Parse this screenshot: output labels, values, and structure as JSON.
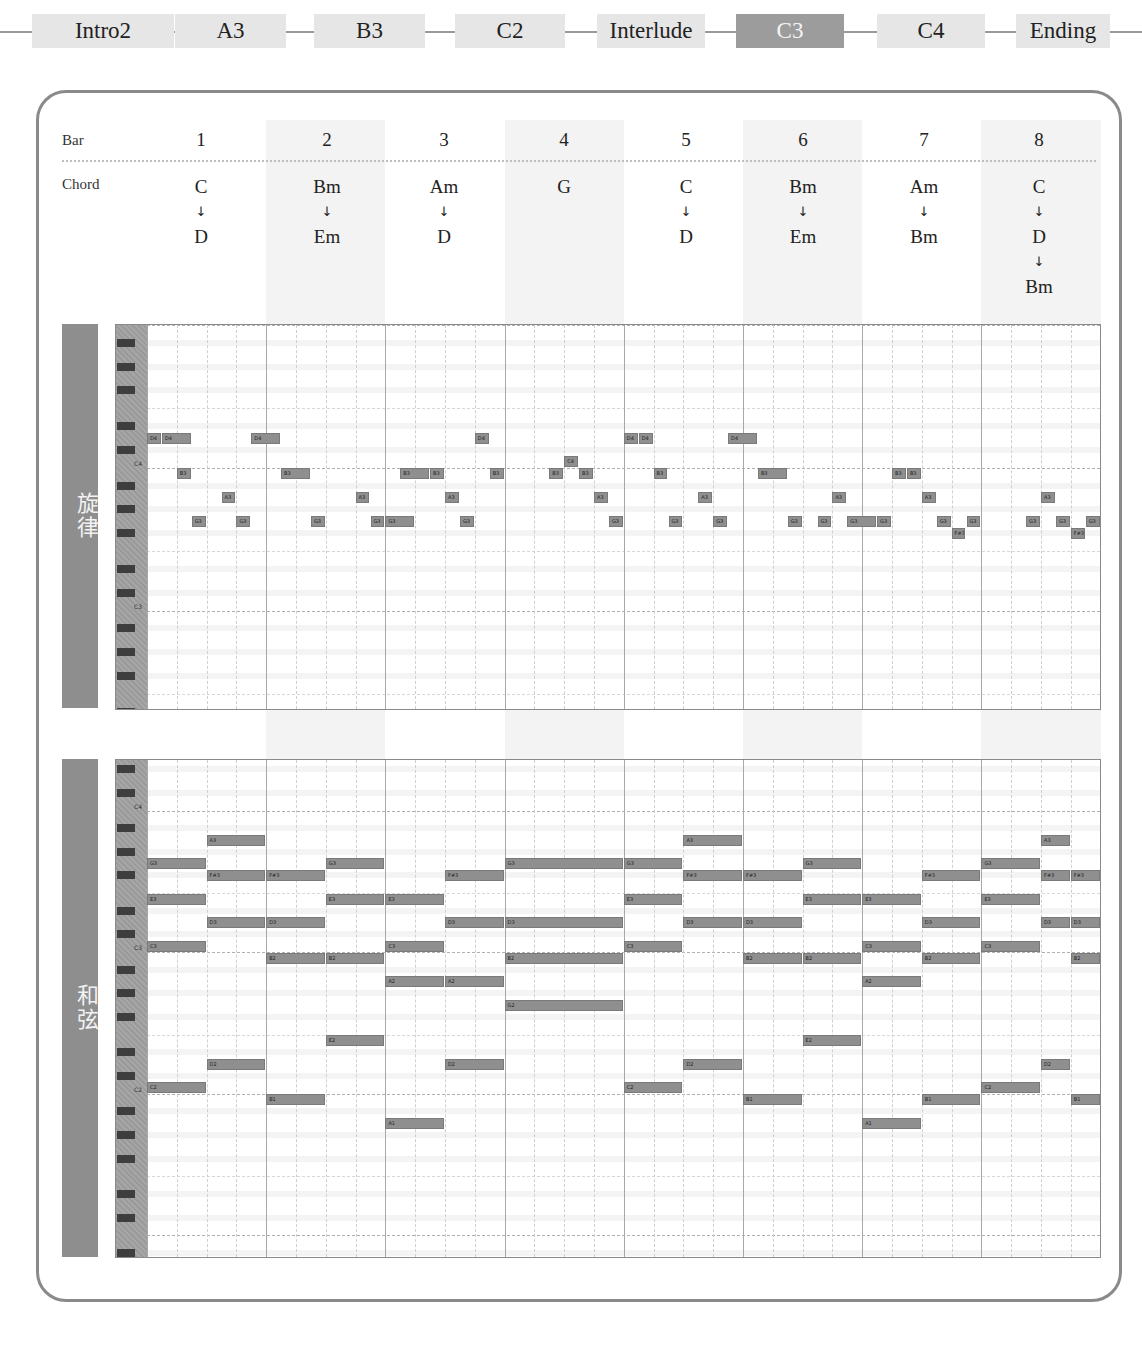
{
  "sections": {
    "items": [
      {
        "label": "Intro2",
        "active": false
      },
      {
        "label": "A3",
        "active": false
      },
      {
        "label": "B3",
        "active": false
      },
      {
        "label": "C2",
        "active": false
      },
      {
        "label": "Interlude",
        "active": false
      },
      {
        "label": "C3",
        "active": true
      },
      {
        "label": "C4",
        "active": false
      },
      {
        "label": "Ending",
        "active": false
      }
    ]
  },
  "header": {
    "bar_label": "Bar",
    "chord_label": "Chord",
    "bars": [
      "1",
      "2",
      "3",
      "4",
      "5",
      "6",
      "7",
      "8"
    ],
    "chords": [
      [
        "C",
        "D"
      ],
      [
        "Bm",
        "Em"
      ],
      [
        "Am",
        "D"
      ],
      [
        "G"
      ],
      [
        "C",
        "D"
      ],
      [
        "Bm",
        "Em"
      ],
      [
        "Am",
        "Bm"
      ],
      [
        "C",
        "D",
        "Bm"
      ]
    ],
    "arrow_glyph": "↓"
  },
  "melody": {
    "label": "旋律",
    "octave_labels": [
      "C4",
      "C3"
    ],
    "notes": [
      {
        "n": "D4",
        "s": 0,
        "d": 0.5
      },
      {
        "n": "D4",
        "s": 0.5,
        "d": 1
      },
      {
        "n": "B3",
        "s": 1,
        "d": 0.5
      },
      {
        "n": "G3",
        "s": 1.5,
        "d": 0.5
      },
      {
        "n": "A3",
        "s": 2.5,
        "d": 0.5
      },
      {
        "n": "G3",
        "s": 3,
        "d": 0.5
      },
      {
        "n": "D4",
        "s": 3.5,
        "d": 1
      },
      {
        "n": "B3",
        "s": 4.5,
        "d": 1
      },
      {
        "n": "G3",
        "s": 5.5,
        "d": 0.5
      },
      {
        "n": "A3",
        "s": 7,
        "d": 0.5
      },
      {
        "n": "G3",
        "s": 7.5,
        "d": 0.5
      },
      {
        "n": "G3",
        "s": 8,
        "d": 1
      },
      {
        "n": "B3",
        "s": 8.5,
        "d": 1
      },
      {
        "n": "B3",
        "s": 9.5,
        "d": 0.5
      },
      {
        "n": "A3",
        "s": 10,
        "d": 0.5
      },
      {
        "n": "G3",
        "s": 10.5,
        "d": 0.5
      },
      {
        "n": "D4",
        "s": 11,
        "d": 0.5
      },
      {
        "n": "B3",
        "s": 11.5,
        "d": 0.5
      },
      {
        "n": "B3",
        "s": 13.5,
        "d": 0.5
      },
      {
        "n": "C4",
        "s": 14,
        "d": 0.5
      },
      {
        "n": "B3",
        "s": 14.5,
        "d": 0.5
      },
      {
        "n": "A3",
        "s": 15,
        "d": 0.5
      },
      {
        "n": "G3",
        "s": 15.5,
        "d": 0.5
      },
      {
        "n": "D4",
        "s": 16,
        "d": 0.5
      },
      {
        "n": "D4",
        "s": 16.5,
        "d": 0.5
      },
      {
        "n": "B3",
        "s": 17,
        "d": 0.5
      },
      {
        "n": "G3",
        "s": 17.5,
        "d": 0.5
      },
      {
        "n": "A3",
        "s": 18.5,
        "d": 0.5
      },
      {
        "n": "G3",
        "s": 19,
        "d": 0.5
      },
      {
        "n": "D4",
        "s": 19.5,
        "d": 1
      },
      {
        "n": "B3",
        "s": 20.5,
        "d": 1
      },
      {
        "n": "G3",
        "s": 21.5,
        "d": 0.5
      },
      {
        "n": "G3",
        "s": 22.5,
        "d": 0.5
      },
      {
        "n": "A3",
        "s": 23,
        "d": 0.5
      },
      {
        "n": "G3",
        "s": 23.5,
        "d": 1
      },
      {
        "n": "G3",
        "s": 24.5,
        "d": 0.5
      },
      {
        "n": "B3",
        "s": 25,
        "d": 0.5
      },
      {
        "n": "B3",
        "s": 25.5,
        "d": 0.5
      },
      {
        "n": "A3",
        "s": 26,
        "d": 0.5
      },
      {
        "n": "G3",
        "s": 26.5,
        "d": 0.5
      },
      {
        "n": "F#3",
        "s": 27,
        "d": 0.5
      },
      {
        "n": "G3",
        "s": 27.5,
        "d": 0.5
      },
      {
        "n": "G3",
        "s": 29.5,
        "d": 0.5
      },
      {
        "n": "A3",
        "s": 30,
        "d": 0.5
      },
      {
        "n": "G3",
        "s": 30.5,
        "d": 0.5
      },
      {
        "n": "F#3",
        "s": 31,
        "d": 0.5
      },
      {
        "n": "G3",
        "s": 31.5,
        "d": 0.5
      }
    ]
  },
  "harmony": {
    "label": "和弦",
    "octave_labels": [
      "C4",
      "C3",
      "C2"
    ],
    "notes": [
      {
        "n": "G3",
        "s": 0,
        "d": 2
      },
      {
        "n": "E3",
        "s": 0,
        "d": 2
      },
      {
        "n": "C3",
        "s": 0,
        "d": 2
      },
      {
        "n": "C2",
        "s": 0,
        "d": 2
      },
      {
        "n": "A3",
        "s": 2,
        "d": 2
      },
      {
        "n": "F#3",
        "s": 2,
        "d": 2
      },
      {
        "n": "D3",
        "s": 2,
        "d": 2
      },
      {
        "n": "D2",
        "s": 2,
        "d": 2
      },
      {
        "n": "F#3",
        "s": 4,
        "d": 2
      },
      {
        "n": "D3",
        "s": 4,
        "d": 2
      },
      {
        "n": "B2",
        "s": 4,
        "d": 2
      },
      {
        "n": "B1",
        "s": 4,
        "d": 2
      },
      {
        "n": "G3",
        "s": 6,
        "d": 2
      },
      {
        "n": "E3",
        "s": 6,
        "d": 2
      },
      {
        "n": "B2",
        "s": 6,
        "d": 2
      },
      {
        "n": "E2",
        "s": 6,
        "d": 2
      },
      {
        "n": "E3",
        "s": 8,
        "d": 2
      },
      {
        "n": "C3",
        "s": 8,
        "d": 2
      },
      {
        "n": "A2",
        "s": 8,
        "d": 2
      },
      {
        "n": "A1",
        "s": 8,
        "d": 2
      },
      {
        "n": "F#3",
        "s": 10,
        "d": 2
      },
      {
        "n": "D3",
        "s": 10,
        "d": 2
      },
      {
        "n": "A2",
        "s": 10,
        "d": 2
      },
      {
        "n": "D2",
        "s": 10,
        "d": 2
      },
      {
        "n": "G3",
        "s": 12,
        "d": 4
      },
      {
        "n": "D3",
        "s": 12,
        "d": 4
      },
      {
        "n": "B2",
        "s": 12,
        "d": 4
      },
      {
        "n": "G2",
        "s": 12,
        "d": 4
      },
      {
        "n": "G3",
        "s": 16,
        "d": 2
      },
      {
        "n": "E3",
        "s": 16,
        "d": 2
      },
      {
        "n": "C3",
        "s": 16,
        "d": 2
      },
      {
        "n": "C2",
        "s": 16,
        "d": 2
      },
      {
        "n": "A3",
        "s": 18,
        "d": 2
      },
      {
        "n": "F#3",
        "s": 18,
        "d": 2
      },
      {
        "n": "D3",
        "s": 18,
        "d": 2
      },
      {
        "n": "D2",
        "s": 18,
        "d": 2
      },
      {
        "n": "F#3",
        "s": 20,
        "d": 2
      },
      {
        "n": "D3",
        "s": 20,
        "d": 2
      },
      {
        "n": "B2",
        "s": 20,
        "d": 2
      },
      {
        "n": "B1",
        "s": 20,
        "d": 2
      },
      {
        "n": "G3",
        "s": 22,
        "d": 2
      },
      {
        "n": "E3",
        "s": 22,
        "d": 2
      },
      {
        "n": "B2",
        "s": 22,
        "d": 2
      },
      {
        "n": "E2",
        "s": 22,
        "d": 2
      },
      {
        "n": "E3",
        "s": 24,
        "d": 2
      },
      {
        "n": "C3",
        "s": 24,
        "d": 2
      },
      {
        "n": "A2",
        "s": 24,
        "d": 2
      },
      {
        "n": "A1",
        "s": 24,
        "d": 2
      },
      {
        "n": "F#3",
        "s": 26,
        "d": 2
      },
      {
        "n": "D3",
        "s": 26,
        "d": 2
      },
      {
        "n": "B2",
        "s": 26,
        "d": 2
      },
      {
        "n": "B1",
        "s": 26,
        "d": 2
      },
      {
        "n": "G3",
        "s": 28,
        "d": 2
      },
      {
        "n": "E3",
        "s": 28,
        "d": 2
      },
      {
        "n": "C3",
        "s": 28,
        "d": 2
      },
      {
        "n": "C2",
        "s": 28,
        "d": 2
      },
      {
        "n": "A3",
        "s": 30,
        "d": 1
      },
      {
        "n": "F#3",
        "s": 30,
        "d": 1
      },
      {
        "n": "D3",
        "s": 30,
        "d": 1
      },
      {
        "n": "D2",
        "s": 30,
        "d": 1
      },
      {
        "n": "F#3",
        "s": 31,
        "d": 1
      },
      {
        "n": "D3",
        "s": 31,
        "d": 1
      },
      {
        "n": "B2",
        "s": 31,
        "d": 1
      },
      {
        "n": "B1",
        "s": 31,
        "d": 1
      }
    ]
  },
  "colors": {
    "active_section": "#9c9c9c",
    "section_bg": "#e6e6e6",
    "note_fill": "#8f8f8f",
    "side_label_bg": "#8e8e8e",
    "panel_border": "#8a8a8a"
  }
}
